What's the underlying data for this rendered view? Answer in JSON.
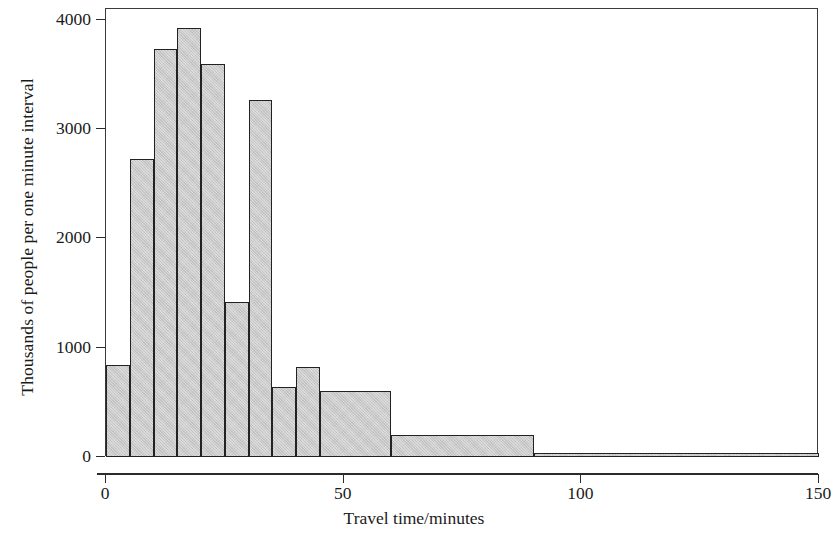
{
  "chart_data": {
    "type": "bar",
    "title": "",
    "subtitle": "",
    "xlabel": "Travel time/minutes",
    "ylabel": "Thousands of people per one minute interval",
    "xlim": [
      0,
      150
    ],
    "ylim": [
      0,
      4100
    ],
    "xticks": [
      0,
      50,
      100,
      150
    ],
    "xtick_labels": [
      "0",
      "50",
      "100",
      "150"
    ],
    "yticks": [
      0,
      1000,
      2000,
      3000,
      4000
    ],
    "ytick_labels": [
      "0",
      "1000",
      "2000",
      "3000",
      "4000"
    ],
    "grid": false,
    "legend": "none",
    "bar_fill_color": "#c9c9c9",
    "bar_edge_color": "#222222",
    "frame_color": "#3a3a3a",
    "bins": [
      {
        "label": "0-5",
        "x0": 0,
        "x1": 5,
        "value": 840
      },
      {
        "label": "5-10",
        "x0": 5,
        "x1": 10,
        "value": 2730
      },
      {
        "label": "10-15",
        "x0": 10,
        "x1": 15,
        "value": 3730
      },
      {
        "label": "15-20",
        "x0": 15,
        "x1": 20,
        "value": 3930
      },
      {
        "label": "20-25",
        "x0": 20,
        "x1": 25,
        "value": 3600
      },
      {
        "label": "25-30",
        "x0": 25,
        "x1": 30,
        "value": 1420
      },
      {
        "label": "30-35",
        "x0": 30,
        "x1": 35,
        "value": 3270
      },
      {
        "label": "35-40",
        "x0": 35,
        "x1": 40,
        "value": 640
      },
      {
        "label": "40-45",
        "x0": 40,
        "x1": 45,
        "value": 820
      },
      {
        "label": "45-60",
        "x0": 45,
        "x1": 60,
        "value": 600
      },
      {
        "label": "60-90",
        "x0": 60,
        "x1": 90,
        "value": 200
      },
      {
        "label": "90-150",
        "x0": 90,
        "x1": 150,
        "value": 40
      }
    ]
  }
}
